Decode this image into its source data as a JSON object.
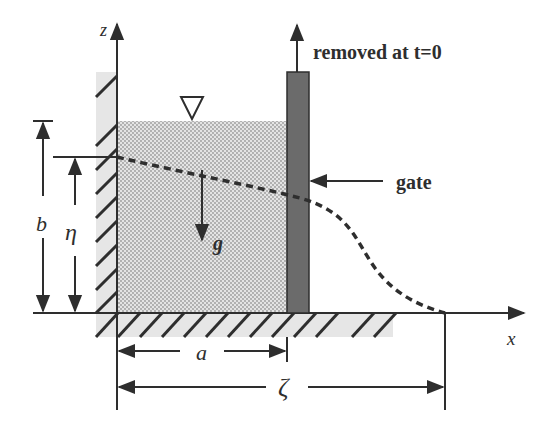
{
  "diagram": {
    "labels": {
      "z_axis": "z",
      "x_axis": "x",
      "gate_removed": "removed at t=0",
      "gate": "gate",
      "gravity": "g",
      "height_b": "b",
      "height_eta": "η",
      "width_a": "a",
      "front_zeta": "ζ"
    },
    "symbols": {
      "free_surface": "free-surface-triangle-icon"
    },
    "colors": {
      "line": "#2e2e2e",
      "water_fill": "#d9d9d9",
      "water_dots": "#9a9a9a",
      "gate_fill": "#6b6b6b",
      "wall_shade": "#e6e6e6"
    }
  }
}
